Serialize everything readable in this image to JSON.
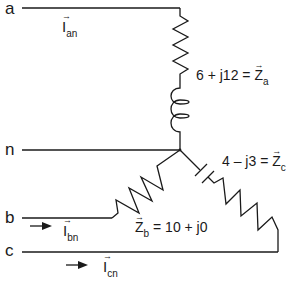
{
  "diagram": {
    "colors": {
      "line": "#1a1a1a",
      "background": "#ffffff"
    },
    "nodes": [
      {
        "id": "a",
        "label": "a"
      },
      {
        "id": "n",
        "label": "n"
      },
      {
        "id": "b",
        "label": "b"
      },
      {
        "id": "c",
        "label": "c"
      }
    ],
    "currents": [
      {
        "id": "Ian",
        "symbol": "I",
        "subscript": "an",
        "arrow_indicator": false
      },
      {
        "id": "Ibn",
        "symbol": "I",
        "subscript": "bn",
        "arrow_indicator": true
      },
      {
        "id": "Icn",
        "symbol": "I",
        "subscript": "cn",
        "arrow_indicator": true
      }
    ],
    "impedances": [
      {
        "id": "Za",
        "value": "6 + j12",
        "equals": "=",
        "symbol": "Z",
        "subscript": "a",
        "elements": [
          "resistor",
          "inductor"
        ]
      },
      {
        "id": "Zb",
        "value": "10 + j0",
        "equals": "=",
        "symbol": "Z",
        "subscript": "b",
        "elements": [
          "resistor"
        ]
      },
      {
        "id": "Zc",
        "value": "4 – j3",
        "equals": "=",
        "symbol": "Z",
        "subscript": "c",
        "elements": [
          "capacitor",
          "resistor"
        ]
      }
    ],
    "phasor_arrow": "⃗",
    "arrow_glyph": "→"
  }
}
